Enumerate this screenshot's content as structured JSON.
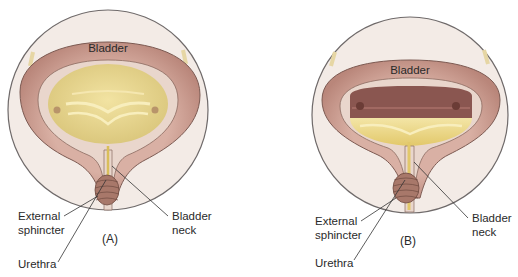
{
  "figure": {
    "panels": [
      {
        "id": "A",
        "panel_label": "(A)",
        "bladder_label": "Bladder",
        "external_sphincter_label_line1": "External",
        "external_sphincter_label_line2": "sphincter",
        "urethra_label": "Urethra",
        "bladder_neck_label_line1": "Bladder",
        "bladder_neck_label_line2": "neck",
        "state": "relaxed / filling (full, pale urine)"
      },
      {
        "id": "B",
        "panel_label": "(B)",
        "bladder_label": "Bladder",
        "external_sphincter_label_line1": "External",
        "external_sphincter_label_line2": "sphincter",
        "urethra_label": "Urethra",
        "bladder_neck_label_line1": "Bladder",
        "bladder_neck_label_line2": "neck",
        "state": "contracting / emptying"
      }
    ],
    "colors": {
      "circle_bg": "#f3ebe6",
      "circle_stroke": "#6f6a6a",
      "muscle_wall": "#c99a90",
      "muscle_dark": "#a87468",
      "mucosa": "#e9d6cc",
      "urine": "#e8d48a",
      "urine_light": "#f3e4a8",
      "upper_dark": "#8a5650",
      "sphincter": "#a8786a",
      "ureter": "#e6d6a4"
    }
  }
}
